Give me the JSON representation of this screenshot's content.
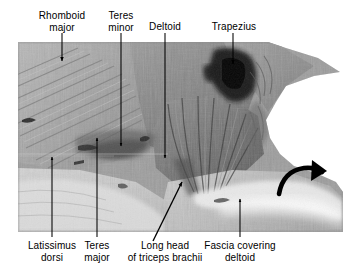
{
  "figure": {
    "type": "anatomical-dissection-photograph",
    "region": "Posterior shoulder and scapular region, superficial dissection",
    "plate_background": "#ffffff",
    "ink_color": "#000000"
  },
  "labels": {
    "top": [
      {
        "id": "rhomboid-major",
        "lines": [
          "Rhomboid",
          "major"
        ],
        "text": "Rhomboid major"
      },
      {
        "id": "teres-minor",
        "lines": [
          "Teres",
          "minor"
        ],
        "text": "Teres minor"
      },
      {
        "id": "deltoid",
        "lines": [
          "Deltoid"
        ],
        "text": "Deltoid"
      },
      {
        "id": "trapezius",
        "lines": [
          "Trapezius"
        ],
        "text": "Trapezius"
      }
    ],
    "bottom": [
      {
        "id": "latissimus-dorsi",
        "lines": [
          "Latissimus",
          "dorsi"
        ],
        "text": "Latissimus dorsi"
      },
      {
        "id": "teres-major",
        "lines": [
          "Teres",
          "major"
        ],
        "text": "Teres major"
      },
      {
        "id": "long-head-triceps",
        "lines": [
          "Long head",
          "of triceps brachii"
        ],
        "text": "Long head of triceps brachii"
      },
      {
        "id": "fascia-covering-deltoid",
        "lines": [
          "Fascia covering",
          "deltoid"
        ],
        "text": "Fascia covering deltoid"
      }
    ]
  },
  "annotations": {
    "curved_arrow": {
      "name": "curved-direction-arrow",
      "description": "Curved black arrow indicating direction of reflection",
      "direction": "up-and-to-the-right"
    }
  }
}
